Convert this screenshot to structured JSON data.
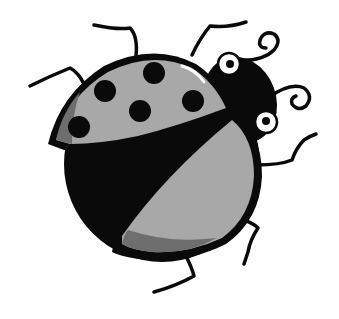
{
  "image": {
    "subject": "Cartoon ladybug illustration",
    "style": "grayscale clip art",
    "spot_count": 6,
    "leg_count": 6,
    "colors": {
      "background": "#ffffff",
      "outline": "#0a0a0a",
      "shell": "#a8a8a8",
      "shell_shade": "#6e6e6e",
      "body": "#0a0a0a",
      "eye_white": "#ffffff",
      "highlight": "#ffffff"
    }
  }
}
